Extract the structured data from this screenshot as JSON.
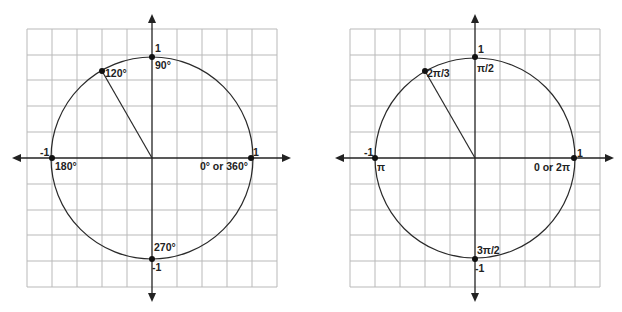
{
  "diagrams": [
    {
      "name": "unit-circle-degrees",
      "center": [
        152,
        158
      ],
      "radius": 100,
      "grid": {
        "left": 27,
        "top": 29,
        "right": 277,
        "bottom": 287,
        "cols": 10,
        "rows": 10
      },
      "axis_ends": {
        "left": 12,
        "right": 291,
        "top": 14,
        "bottom": 302
      },
      "points": {
        "top": {
          "axis_label": "1",
          "angle_label": "90°"
        },
        "left": {
          "axis_label": "-1",
          "angle_label": "180°"
        },
        "right": {
          "axis_label": "1",
          "angle_label": "0° or 360°"
        },
        "bottom": {
          "axis_label": "-1",
          "angle_label": "270°"
        },
        "highlighted": {
          "angle_deg": 120,
          "angle_label": "120°"
        }
      }
    },
    {
      "name": "unit-circle-radians",
      "center": [
        475,
        158
      ],
      "radius": 100,
      "grid": {
        "left": 350,
        "top": 29,
        "right": 600,
        "bottom": 287,
        "cols": 10,
        "rows": 10
      },
      "axis_ends": {
        "left": 335,
        "right": 614,
        "top": 14,
        "bottom": 302
      },
      "points": {
        "top": {
          "axis_label": "1",
          "angle_label": "π/2"
        },
        "left": {
          "axis_label": "-1",
          "angle_label": "π"
        },
        "right": {
          "axis_label": "1",
          "angle_label": "0 or 2π"
        },
        "bottom": {
          "axis_label": "-1",
          "angle_label": "3π/2"
        },
        "highlighted": {
          "angle_deg": 120,
          "angle_label": "2π/3"
        }
      }
    }
  ],
  "colors": {
    "grid": "#b9b9b9",
    "axis": "#222222",
    "circle": "#2a2a2a"
  }
}
